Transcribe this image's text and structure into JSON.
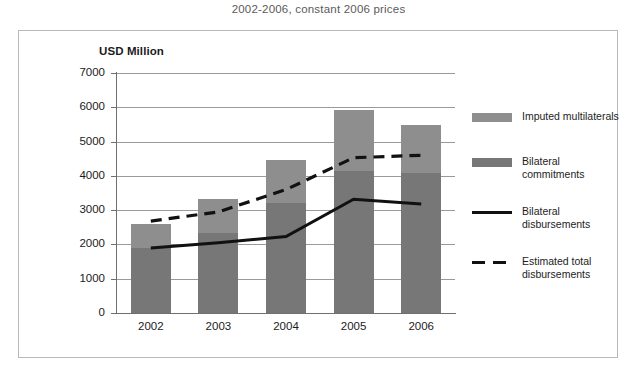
{
  "subtitle": "2002-2006, constant 2006 prices",
  "axis_title": "USD Million",
  "legend": {
    "items": [
      {
        "label": "Imputed multilaterals",
        "marker": "swatch",
        "color": "#8e8e8e"
      },
      {
        "label": "Bilateral commitments",
        "marker": "swatch",
        "color": "#777777"
      },
      {
        "label": "Bilateral disbursements",
        "marker": "solid-line",
        "color": "#111111"
      },
      {
        "label": "Estimated total disbursements",
        "marker": "dashed-line",
        "color": "#111111"
      }
    ]
  },
  "chart_data": {
    "type": "bar",
    "title": "",
    "subtitle": "2002-2006, constant 2006 prices",
    "xlabel": "",
    "ylabel": "USD Million",
    "ylim": [
      0,
      7000
    ],
    "ytick_values": [
      0,
      1000,
      2000,
      3000,
      4000,
      5000,
      6000,
      7000
    ],
    "ytick_labels": [
      "0",
      "1000",
      "2000",
      "3000",
      "4000",
      "5000",
      "6000",
      "7000"
    ],
    "grid": true,
    "legend_position": "right",
    "stacked": true,
    "categories": [
      "2002",
      "2003",
      "2004",
      "2005",
      "2006"
    ],
    "series": [
      {
        "name": "Bilateral commitments",
        "type": "bar",
        "stack": "total",
        "color": "#777777",
        "values": [
          1900,
          2320,
          3200,
          4150,
          4080
        ]
      },
      {
        "name": "Imputed multilaterals",
        "type": "bar",
        "stack": "total",
        "color": "#8e8e8e",
        "values": [
          700,
          1000,
          1250,
          1770,
          1400
        ]
      },
      {
        "name": "Bilateral disbursements",
        "type": "line",
        "style": "solid",
        "color": "#111111",
        "values": [
          1900,
          2050,
          2230,
          3320,
          3180
        ]
      },
      {
        "name": "Estimated total disbursements",
        "type": "line",
        "style": "dashed",
        "color": "#111111",
        "values": [
          2680,
          2950,
          3600,
          4530,
          4600
        ]
      }
    ],
    "bar_totals": [
      2600,
      3320,
      4450,
      5920,
      5480
    ]
  }
}
